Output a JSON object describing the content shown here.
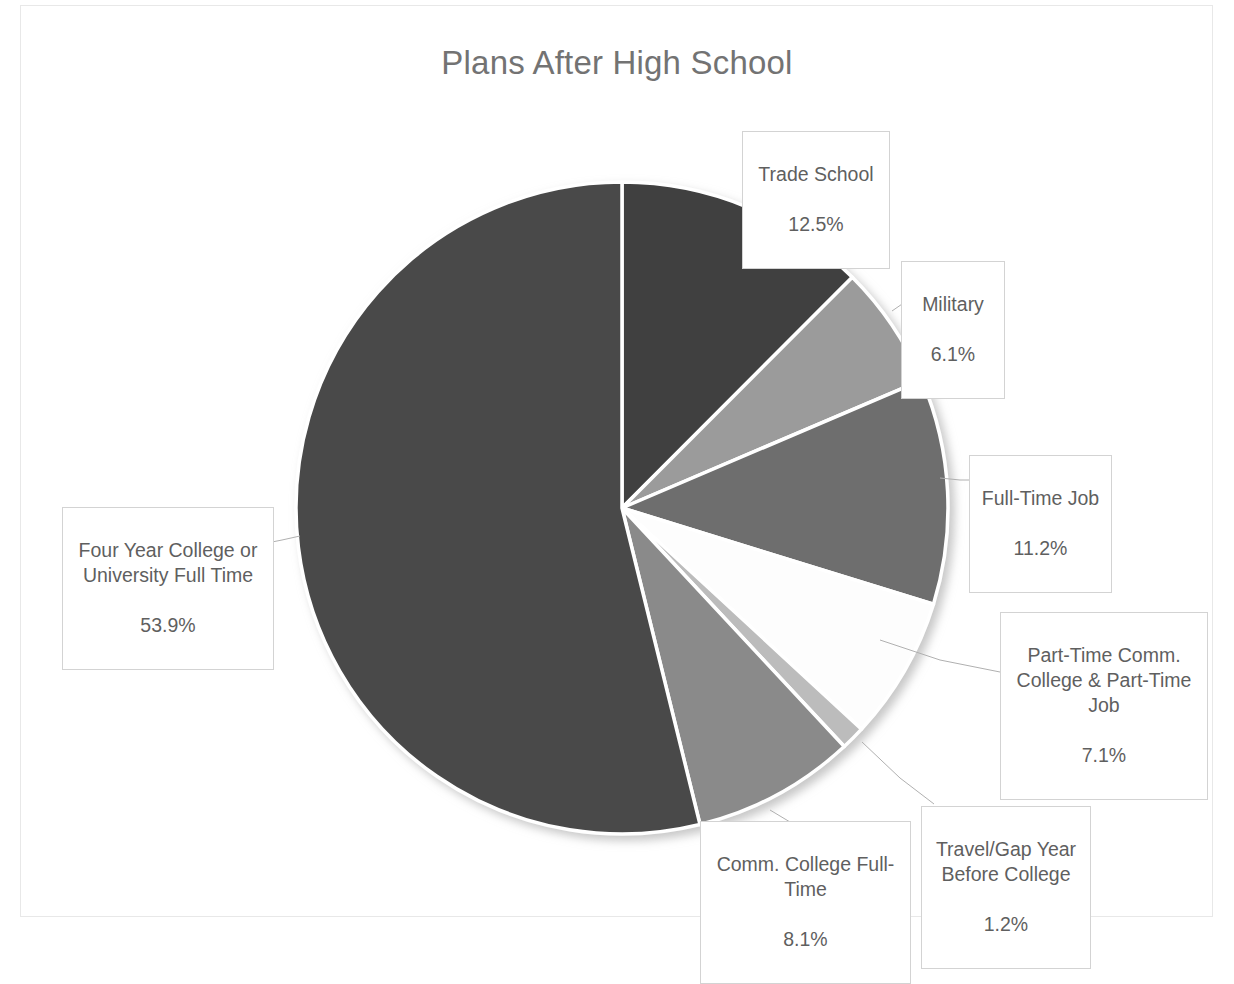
{
  "chart_data": {
    "type": "pie",
    "title": "Plans After High School",
    "xlabel": "",
    "ylabel": "",
    "legend_position": "none",
    "grid": false,
    "labels_show_percent": true,
    "categories": [
      "Trade School",
      "Military",
      "Full-Time Job",
      "Part-Time Comm. College & Part-Time Job",
      "Travel/Gap Year Before College",
      "Comm. College Full-Time",
      "Four Year College or University Full Time"
    ],
    "values": [
      12.5,
      6.1,
      11.2,
      7.1,
      1.2,
      8.1,
      53.9
    ],
    "value_labels": [
      "12.5%",
      "6.1%",
      "11.2%",
      "7.1%",
      "1.2%",
      "8.1%",
      "53.9%"
    ],
    "slice_colors": [
      "#3f3f3f",
      "#9b9b9b",
      "#6e6e6e",
      "#fdfdfd",
      "#bcbcbc",
      "#8a8a8a",
      "#4a4a4a"
    ],
    "slice_angles_deg": [
      45.0,
      21.96,
      40.32,
      25.56,
      4.32,
      29.16,
      194.04
    ],
    "start_angle_deg": 0,
    "direction": "clockwise"
  },
  "chart": {
    "title": "Plans After High School",
    "title_color": "#737373",
    "background": "#ffffff",
    "border_color": "#e8e8e8",
    "separator_color": "#ffffff",
    "callout_border_color": "#d3d3d3",
    "callout_text_color": "#5f5f5f",
    "leader_line_color": "#b0b0b0"
  },
  "callouts": [
    {
      "id": "trade-school",
      "label": "Trade School",
      "percent": "12.5%"
    },
    {
      "id": "military",
      "label": "Military",
      "percent": "6.1%"
    },
    {
      "id": "full-time-job",
      "label": "Full-Time Job",
      "percent": "11.2%"
    },
    {
      "id": "part-time",
      "label": "Part-Time Comm. College & Part-Time Job",
      "percent": "7.1%"
    },
    {
      "id": "travel-gap-year",
      "label": "Travel/Gap Year Before College",
      "percent": "1.2%"
    },
    {
      "id": "comm-college",
      "label": "Comm. College Full-Time",
      "percent": "8.1%"
    },
    {
      "id": "four-year",
      "label": "Four Year College or University Full Time",
      "percent": "53.9%"
    }
  ]
}
